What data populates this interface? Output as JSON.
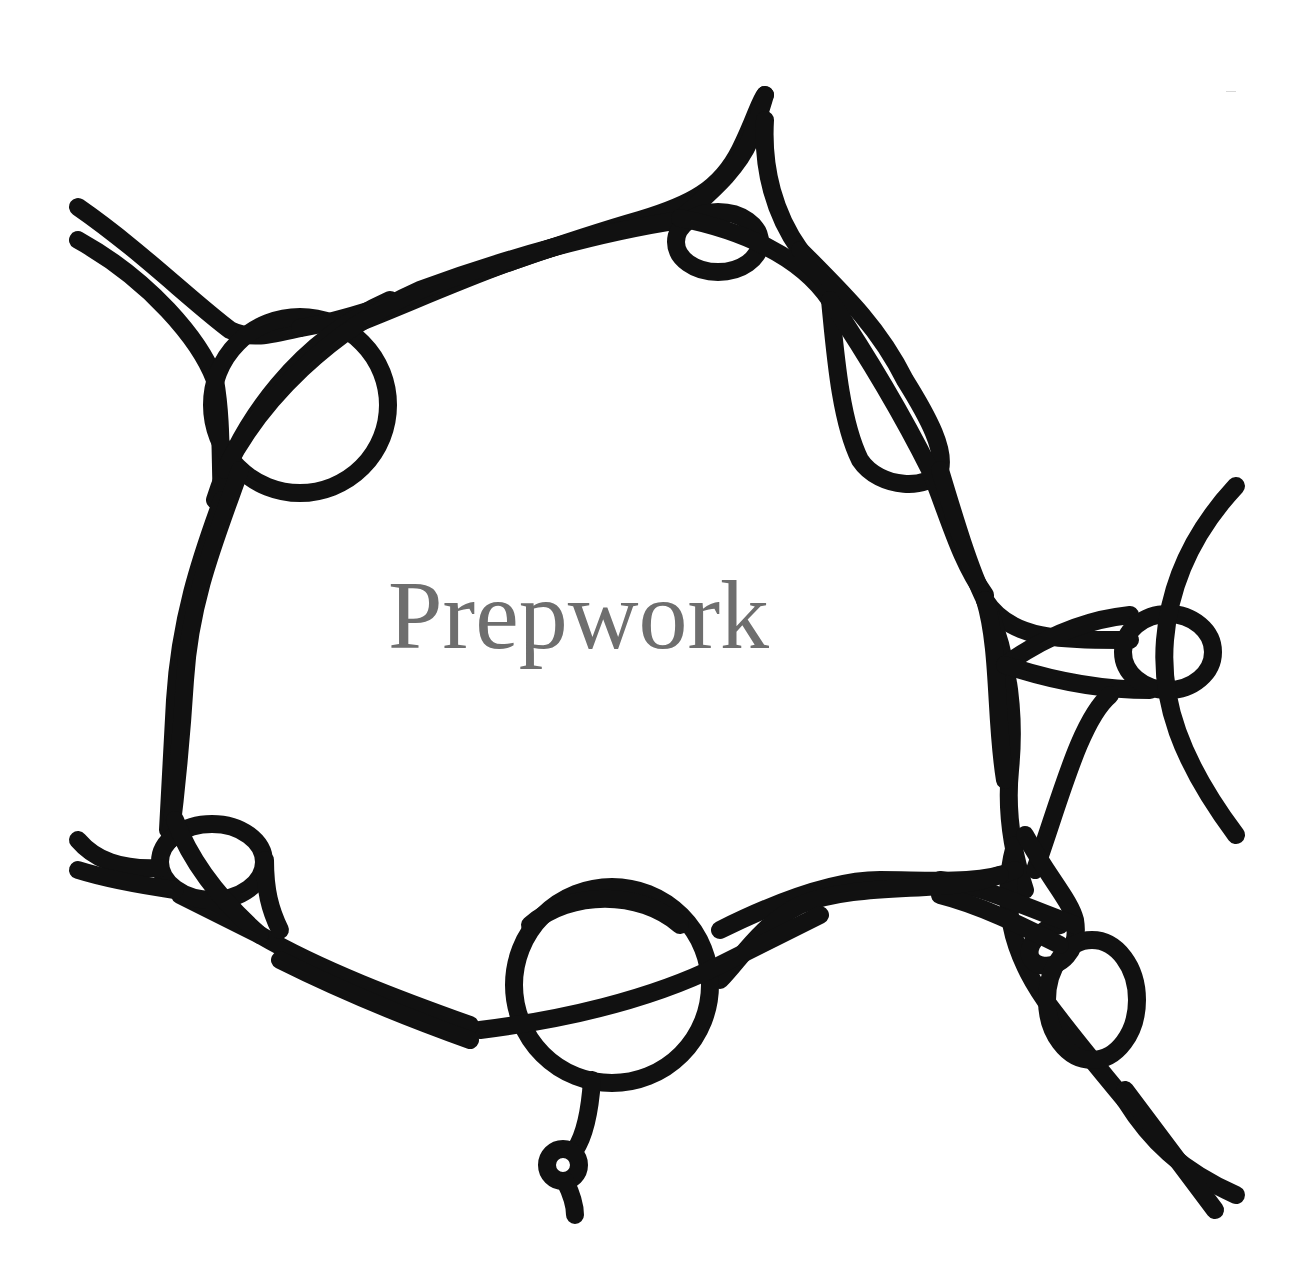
{
  "page": {
    "title": "Prepwork",
    "title_color": "#6e6e6e",
    "stroke_color": "#111111",
    "background": "#ffffff"
  },
  "illustration": {
    "description": "Black looping line-art of roads/tracks with roundabouts surrounding the title",
    "stroke_width": 18
  }
}
